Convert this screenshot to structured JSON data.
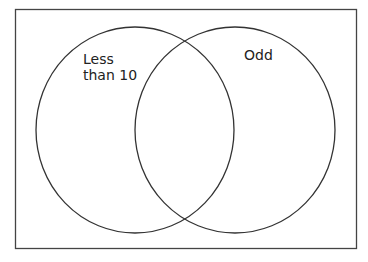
{
  "diagram": {
    "type": "venn",
    "colors": {
      "stroke": "#333333",
      "background": "#ffffff",
      "text": "#222222"
    },
    "sets": [
      {
        "id": "left",
        "label": "Less\nthan 10"
      },
      {
        "id": "right",
        "label": "Odd"
      }
    ]
  }
}
